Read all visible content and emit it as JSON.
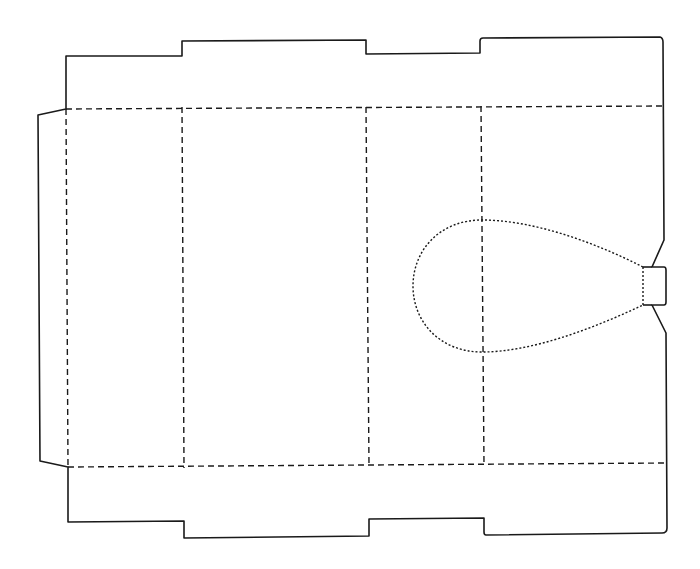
{
  "diagram": {
    "type": "box-dieline",
    "panels": [
      "glue-flap",
      "panel-1",
      "panel-2",
      "panel-3",
      "panel-4"
    ],
    "line_styles": {
      "cut": "solid",
      "fold": "dashed",
      "perforation": "dotted"
    },
    "colors": {
      "background": "#ffffff",
      "line": "#1a1a1a"
    },
    "features": [
      "teardrop-window-perforation",
      "hanger-tab"
    ]
  }
}
